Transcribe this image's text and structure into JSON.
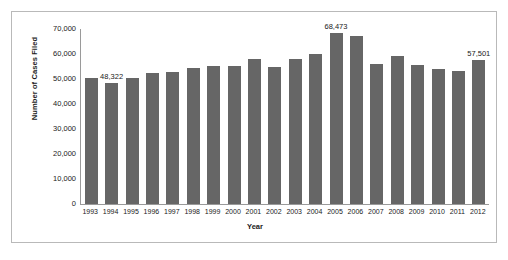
{
  "chart_data": {
    "type": "bar",
    "title": "",
    "xlabel": "Year",
    "ylabel": "Number of Cases Filed",
    "ylim": [
      0,
      70000
    ],
    "ytick_labels": [
      "70,000",
      "60,000",
      "50,000",
      "40,000",
      "30,000",
      "20,000",
      "10,000",
      "0"
    ],
    "ytick_values": [
      70000,
      60000,
      50000,
      40000,
      30000,
      20000,
      10000,
      0
    ],
    "grid": false,
    "legend": false,
    "bar_color": "#666666",
    "categories": [
      "1993",
      "1994",
      "1995",
      "1996",
      "1997",
      "1998",
      "1999",
      "2000",
      "2001",
      "2002",
      "2003",
      "2004",
      "2005",
      "2006",
      "2007",
      "2008",
      "2009",
      "2010",
      "2011",
      "2012"
    ],
    "values": [
      50300,
      48322,
      50400,
      52300,
      52900,
      54500,
      55300,
      55300,
      57900,
      54900,
      58200,
      60200,
      68473,
      67300,
      56200,
      59300,
      55800,
      54200,
      53200,
      57501
    ],
    "annotations": [
      {
        "category": "1994",
        "text": "48,322",
        "value": 48322
      },
      {
        "category": "2005",
        "text": "68,473",
        "value": 68473
      },
      {
        "category": "2012",
        "text": "57,501",
        "value": 57501
      }
    ]
  }
}
